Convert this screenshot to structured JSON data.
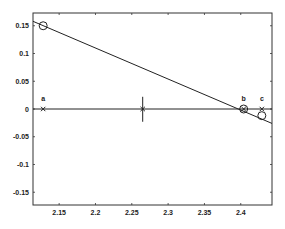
{
  "chart_data": {
    "type": "line",
    "title": "",
    "xlabel": "",
    "ylabel": "",
    "xlim": [
      2.114,
      2.443
    ],
    "ylim": [
      -0.173,
      0.173
    ],
    "grid": false,
    "legend": null,
    "x_ticks": [
      2.15,
      2.2,
      2.25,
      2.3,
      2.35,
      2.4
    ],
    "x_tick_labels": [
      "2.15",
      "2.2",
      "2.25",
      "2.3",
      "2.35",
      "2.4"
    ],
    "y_ticks": [
      0.15,
      0.1,
      0.05,
      0,
      -0.05,
      -0.1,
      -0.15
    ],
    "y_tick_labels": [
      "0.15",
      "0.1",
      "0.05",
      "0",
      "-0.05",
      "-0.1",
      "-0.15"
    ],
    "series": [
      {
        "name": "sloped line",
        "style": "line",
        "x": [
          2.114,
          2.443
        ],
        "y": [
          0.158,
          -0.026
        ]
      },
      {
        "name": "zero line",
        "style": "line",
        "x": [
          2.114,
          2.443
        ],
        "y": [
          0.0,
          0.0
        ]
      },
      {
        "name": "circle markers",
        "style": "marker-circle",
        "x": [
          2.128,
          2.404,
          2.429
        ],
        "y": [
          0.15,
          0.0,
          -0.012
        ]
      },
      {
        "name": "x markers",
        "style": "marker-x",
        "x": [
          2.128,
          2.265,
          2.404,
          2.429
        ],
        "y": [
          0.0,
          0.0,
          0.0,
          0.0
        ]
      }
    ],
    "annotations": [
      {
        "text": "a",
        "x": 2.128,
        "y": 0.0
      },
      {
        "text": "b",
        "x": 2.404,
        "y": 0.0
      },
      {
        "text": "c",
        "x": 2.429,
        "y": 0.0
      }
    ],
    "error_bar": {
      "x": 2.265,
      "y": 0.0,
      "y_low": -0.023,
      "y_high": 0.022
    }
  }
}
